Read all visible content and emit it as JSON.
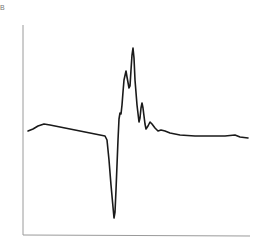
{
  "panel_label": "B",
  "colors": {
    "line": "#1a1a1a",
    "axis": "#9a9a9a",
    "background": "#ffffff"
  },
  "chart_data": {
    "type": "line",
    "title": "",
    "xlabel": "",
    "ylabel": "",
    "grid": false,
    "legend": null,
    "axes": {
      "x_visible": true,
      "y_visible": true,
      "ticks": false
    },
    "series": [
      {
        "name": "trace",
        "points_px": [
          [
            28,
            131
          ],
          [
            33,
            129
          ],
          [
            38,
            126
          ],
          [
            44,
            124
          ],
          [
            50,
            125
          ],
          [
            60,
            127
          ],
          [
            70,
            129
          ],
          [
            80,
            131
          ],
          [
            90,
            133
          ],
          [
            100,
            135
          ],
          [
            105,
            136
          ],
          [
            107,
            140
          ],
          [
            109,
            160
          ],
          [
            111,
            185
          ],
          [
            113,
            207
          ],
          [
            114,
            218
          ],
          [
            115,
            212
          ],
          [
            116,
            190
          ],
          [
            117,
            165
          ],
          [
            118,
            140
          ],
          [
            119,
            119
          ],
          [
            120,
            113
          ],
          [
            121,
            114
          ],
          [
            122,
            105
          ],
          [
            123,
            92
          ],
          [
            124,
            80
          ],
          [
            126,
            71
          ],
          [
            127,
            77
          ],
          [
            129,
            88
          ],
          [
            130,
            86
          ],
          [
            131,
            70
          ],
          [
            132,
            55
          ],
          [
            133,
            48
          ],
          [
            134,
            58
          ],
          [
            135,
            80
          ],
          [
            137,
            105
          ],
          [
            139,
            122
          ],
          [
            140,
            118
          ],
          [
            141,
            108
          ],
          [
            142,
            103
          ],
          [
            143,
            108
          ],
          [
            145,
            124
          ],
          [
            146,
            129
          ],
          [
            148,
            126
          ],
          [
            150,
            122
          ],
          [
            152,
            124
          ],
          [
            155,
            128
          ],
          [
            158,
            131
          ],
          [
            161,
            130
          ],
          [
            165,
            131
          ],
          [
            170,
            133
          ],
          [
            180,
            135
          ],
          [
            195,
            136
          ],
          [
            210,
            136
          ],
          [
            225,
            136
          ],
          [
            235,
            135
          ],
          [
            240,
            137
          ],
          [
            248,
            138
          ]
        ]
      }
    ]
  }
}
